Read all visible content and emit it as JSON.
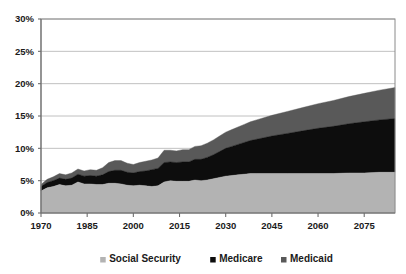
{
  "chart_data": {
    "type": "area",
    "stacked": true,
    "title": "",
    "subtitle": "",
    "xlabel": "",
    "ylabel": "",
    "xlim": [
      1970,
      2085
    ],
    "ylim": [
      0,
      30
    ],
    "yticks": [
      0,
      5,
      10,
      15,
      20,
      25,
      30
    ],
    "ytick_labels": [
      "0%",
      "5%",
      "10%",
      "15%",
      "20%",
      "25%",
      "30%"
    ],
    "xticks": [
      1970,
      1985,
      2000,
      2015,
      2030,
      2045,
      2060,
      2075
    ],
    "xtick_labels": [
      "1970",
      "1985",
      "2000",
      "2015",
      "2030",
      "2045",
      "2060",
      "2075"
    ],
    "grid": true,
    "grid_axis": "y",
    "legend_position": "bottom",
    "value_unit": "percent of GDP",
    "x": [
      1970,
      1972,
      1974,
      1976,
      1978,
      1980,
      1982,
      1984,
      1986,
      1988,
      1990,
      1992,
      1994,
      1996,
      1998,
      2000,
      2002,
      2004,
      2006,
      2008,
      2010,
      2012,
      2014,
      2016,
      2018,
      2020,
      2022,
      2024,
      2026,
      2028,
      2030,
      2032,
      2034,
      2036,
      2038,
      2040,
      2045,
      2050,
      2055,
      2060,
      2065,
      2070,
      2075,
      2080,
      2085
    ],
    "series": [
      {
        "name": "Social Security",
        "color": "#b3b3b3",
        "values": [
          3.4,
          3.9,
          4.1,
          4.4,
          4.2,
          4.3,
          4.8,
          4.5,
          4.5,
          4.4,
          4.4,
          4.6,
          4.6,
          4.5,
          4.3,
          4.2,
          4.3,
          4.2,
          4.1,
          4.2,
          4.8,
          5.0,
          4.9,
          4.9,
          4.9,
          5.1,
          5.0,
          5.1,
          5.3,
          5.5,
          5.7,
          5.8,
          5.9,
          6.0,
          6.1,
          6.1,
          6.1,
          6.1,
          6.1,
          6.1,
          6.1,
          6.2,
          6.2,
          6.3,
          6.3
        ]
      },
      {
        "name": "Medicare",
        "color": "#0d0d0d",
        "values": [
          0.7,
          0.8,
          0.9,
          1.0,
          1.0,
          1.1,
          1.2,
          1.2,
          1.3,
          1.3,
          1.5,
          1.8,
          2.0,
          2.1,
          2.0,
          2.0,
          2.1,
          2.3,
          2.6,
          2.7,
          3.0,
          2.9,
          2.9,
          3.0,
          3.0,
          3.2,
          3.3,
          3.5,
          3.7,
          4.0,
          4.3,
          4.5,
          4.7,
          4.9,
          5.1,
          5.3,
          5.8,
          6.2,
          6.6,
          7.0,
          7.3,
          7.6,
          7.9,
          8.1,
          8.3
        ]
      },
      {
        "name": "Medicaid",
        "color": "#595959",
        "values": [
          0.3,
          0.5,
          0.6,
          0.7,
          0.7,
          0.8,
          0.8,
          0.8,
          0.9,
          0.9,
          1.1,
          1.4,
          1.5,
          1.5,
          1.4,
          1.3,
          1.4,
          1.5,
          1.5,
          1.6,
          1.9,
          1.8,
          1.8,
          1.9,
          1.9,
          2.0,
          2.1,
          2.2,
          2.3,
          2.4,
          2.5,
          2.6,
          2.7,
          2.8,
          2.9,
          3.0,
          3.2,
          3.4,
          3.6,
          3.8,
          4.0,
          4.2,
          4.4,
          4.6,
          4.8
        ]
      }
    ],
    "legend": [
      {
        "label": "Social Security",
        "color": "#b3b3b3"
      },
      {
        "label": "Medicare",
        "color": "#0d0d0d"
      },
      {
        "label": "Medicaid",
        "color": "#595959"
      }
    ]
  }
}
